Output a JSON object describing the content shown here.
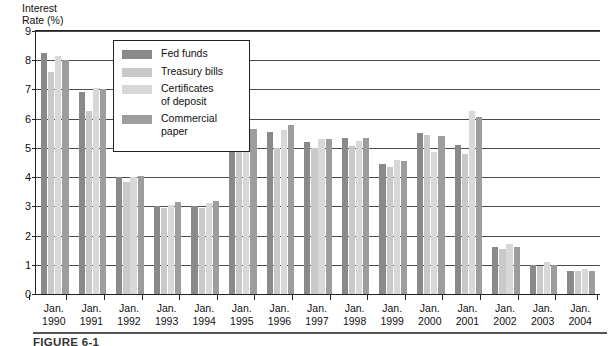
{
  "chart_data": {
    "type": "bar",
    "title": "",
    "xlabel": "",
    "ylabel": "Interest\nRate (%)",
    "ylim": [
      0,
      9
    ],
    "yticks": [
      0,
      1,
      2,
      3,
      4,
      5,
      6,
      7,
      8,
      9
    ],
    "ytick_labels": [
      "0",
      "1",
      "2",
      "3",
      "4",
      "5",
      "6",
      "7",
      "8",
      "9"
    ],
    "grid": true,
    "legend_position": "upper-left-inset",
    "categories": [
      "Jan.\n1990",
      "Jan.\n1991",
      "Jan.\n1992",
      "Jan.\n1993",
      "Jan.\n1994",
      "Jan.\n1995",
      "Jan.\n1996",
      "Jan.\n1997",
      "Jan.\n1998",
      "Jan.\n1999",
      "Jan.\n2000",
      "Jan.\n2001",
      "Jan.\n2002",
      "Jan.\n2003",
      "Jan.\n2004"
    ],
    "series": [
      {
        "name": "Fed funds",
        "color": "#8a8a8a",
        "values": [
          8.25,
          6.9,
          4.0,
          3.0,
          3.0,
          5.55,
          5.55,
          5.2,
          5.35,
          4.45,
          5.5,
          5.1,
          1.6,
          1.0,
          0.8
        ]
      },
      {
        "name": "Treasury bills",
        "color": "#c9c9c9",
        "values": [
          7.6,
          6.25,
          3.85,
          2.95,
          2.95,
          5.55,
          5.0,
          5.0,
          5.05,
          4.35,
          5.45,
          4.8,
          1.55,
          0.95,
          0.8
        ]
      },
      {
        "name": "Certificates\nof deposit",
        "color": "#d8d8d8",
        "values": [
          8.15,
          7.05,
          4.0,
          3.05,
          3.1,
          6.4,
          5.6,
          5.3,
          5.25,
          4.6,
          4.85,
          6.25,
          1.7,
          1.1,
          0.85
        ]
      },
      {
        "name": "Commercial\npaper",
        "color": "#9d9d9d",
        "values": [
          8.0,
          7.0,
          4.05,
          3.15,
          3.2,
          5.65,
          5.8,
          5.3,
          5.35,
          4.55,
          5.4,
          6.05,
          1.6,
          1.0,
          0.8
        ]
      }
    ]
  },
  "legend": {
    "items": [
      {
        "label": "Fed funds",
        "color": "#8a8a8a"
      },
      {
        "label": "Treasury bills",
        "color": "#c9c9c9"
      },
      {
        "label": "Certificates\nof deposit",
        "color": "#d8d8d8"
      },
      {
        "label": "Commercial\npaper",
        "color": "#9d9d9d"
      }
    ]
  },
  "caption": {
    "text": "FIGURE 6-1"
  }
}
